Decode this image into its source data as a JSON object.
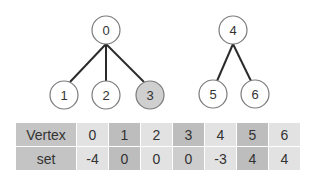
{
  "graph": {
    "nodes": [
      {
        "id": "0",
        "x": 106,
        "y": 30,
        "highlight": false
      },
      {
        "id": "1",
        "x": 64,
        "y": 95,
        "highlight": false
      },
      {
        "id": "2",
        "x": 106,
        "y": 95,
        "highlight": false
      },
      {
        "id": "3",
        "x": 150,
        "y": 95,
        "highlight": true
      },
      {
        "id": "4",
        "x": 233,
        "y": 30,
        "highlight": false
      },
      {
        "id": "5",
        "x": 213,
        "y": 94,
        "highlight": false
      },
      {
        "id": "6",
        "x": 255,
        "y": 94,
        "highlight": false
      }
    ],
    "edges": [
      [
        "0",
        "1"
      ],
      [
        "0",
        "2"
      ],
      [
        "0",
        "3"
      ],
      [
        "4",
        "5"
      ],
      [
        "4",
        "6"
      ]
    ]
  },
  "table": {
    "row_headers": [
      "Vertex",
      "set"
    ],
    "vertex": [
      "0",
      "1",
      "2",
      "3",
      "4",
      "5",
      "6"
    ],
    "set": [
      "-4",
      "0",
      "0",
      "0",
      "-3",
      "4",
      "4"
    ],
    "column_shade": [
      "light",
      "dark",
      "light",
      "dark",
      "light",
      "dark",
      "light"
    ]
  }
}
